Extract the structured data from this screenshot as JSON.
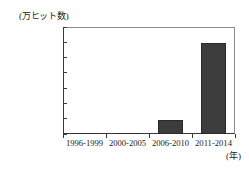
{
  "chart_data": {
    "type": "bar",
    "title": "",
    "subtitle": "",
    "categories": [
      "1996-1999",
      "2000-2005",
      "2006-2010",
      "2011-2014"
    ],
    "values": [
      2,
      25,
      450,
      3000
    ],
    "series": [
      {
        "name": "ヒット数",
        "values": [
          2,
          25,
          450,
          3000
        ]
      }
    ],
    "xlabel": "(年)",
    "ylabel": "(万ヒット数)",
    "ylim": [
      0,
      3500
    ],
    "y_ticks": [
      0,
      500,
      1000,
      1500,
      2000,
      2500,
      3000,
      3500
    ],
    "y_tick_labels": [
      "0",
      "500",
      "1000",
      "1500",
      "2000",
      "2500",
      "3000",
      "3500"
    ],
    "grid": false,
    "legend": false,
    "legend_position": "none",
    "bar_color": "#3c3c3c",
    "bar_edge_color": "#2a2a2a",
    "axis_color": "#3a3a3a",
    "background": "#ffffff"
  },
  "axis": {
    "y_unit_caption": "(万ヒット数)",
    "x_unit_caption": "(年)"
  }
}
